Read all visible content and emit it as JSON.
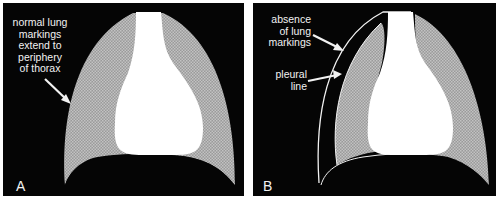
{
  "figure": {
    "panels": [
      {
        "letter": "A",
        "annotations": [
          {
            "text_lines": [
              "normal lung",
              "markings",
              "extend to",
              "periphery",
              "of thorax"
            ]
          }
        ]
      },
      {
        "letter": "B",
        "annotations": [
          {
            "text_lines": [
              "absence",
              "of lung",
              "markings"
            ]
          },
          {
            "text_lines": [
              "pleural",
              "line"
            ]
          }
        ]
      }
    ],
    "colors": {
      "background": "#050505",
      "lung_texture": "#a8a8a8",
      "mediastinum": "#ffffff",
      "text": "#f2f2f2",
      "border": "#ffffff"
    }
  }
}
